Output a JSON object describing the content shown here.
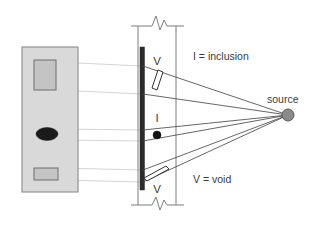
{
  "diagram": {
    "labels": {
      "legend_inclusion": "I = inclusion",
      "legend_void": "V = void",
      "source": "source",
      "marker_void_top": "V",
      "marker_void_bottom": "V",
      "marker_inclusion": "I"
    },
    "colors": {
      "film_fill": "#d9d9d9",
      "film_stroke": "#8c8c8c",
      "film_defect_fill": "#c4c4c4",
      "film_defect_stroke": "#6f6f6f",
      "film_inclusion_fill": "#1a1a1a",
      "wall_bar": "#2b2b2b",
      "wall_line": "#7d7d7d",
      "ray_line": "#4a4a4a",
      "projection_line": "#cfcfcf",
      "source_dot": "#8a8a8a",
      "source_dot_stroke": "#5c5c5c",
      "text": "#3a3a3a",
      "background": "#ffffff"
    },
    "geometry": {
      "source_point": {
        "x": 288,
        "y": 115,
        "r": 6
      },
      "film_panel": {
        "x": 22,
        "y": 47,
        "width": 56,
        "height": 145
      },
      "detector_bar": {
        "x": 140,
        "y": 47,
        "width": 4.5,
        "height": 143
      },
      "wall_right_line_x": 176,
      "wall_top_y": 26,
      "wall_bottom_y": 205
    },
    "features": [
      {
        "name": "void-top",
        "type": "void",
        "marker": "V",
        "film_shape": {
          "kind": "rect",
          "x": 34,
          "y": 60,
          "width": 22,
          "height": 30
        },
        "wall_shape": {
          "kind": "parallelogram",
          "cx": 156,
          "cy": 80
        }
      },
      {
        "name": "inclusion-middle",
        "type": "inclusion",
        "marker": "I",
        "film_shape": {
          "kind": "ellipse",
          "cx": 47,
          "cy": 134,
          "rx": 11,
          "ry": 6.5
        },
        "wall_shape": {
          "kind": "circle",
          "cx": 157,
          "cy": 135,
          "r": 4
        }
      },
      {
        "name": "void-bottom",
        "type": "void",
        "marker": "V",
        "film_shape": {
          "kind": "rect",
          "x": 34,
          "y": 168,
          "width": 24,
          "height": 12
        },
        "wall_shape": {
          "kind": "parallelogram",
          "cx": 154,
          "cy": 172
        }
      }
    ]
  }
}
